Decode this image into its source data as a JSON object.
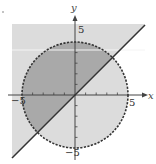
{
  "graph": {
    "x_axis_label": "x",
    "y_axis_label": "y",
    "ticks": {
      "x_pos": "5",
      "x_neg": "−5",
      "y_pos": "5",
      "y_neg": "−5"
    },
    "circle": {
      "equation": "x^2 + y^2 = 25",
      "radius": 5,
      "style": "dashed"
    },
    "line": {
      "equation": "y = x",
      "style": "solid"
    },
    "colors": {
      "background": "#ffffff",
      "light_shade": "#dcdcdc",
      "dark_shade": "#a9a9a9",
      "stroke": "#333333"
    }
  }
}
